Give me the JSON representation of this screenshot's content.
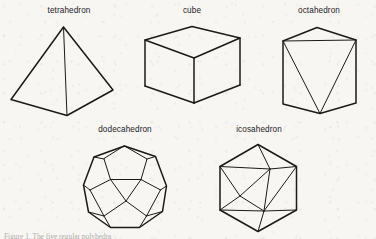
{
  "figure": {
    "background_color": "#f7f6f3",
    "ink_color": "#1c1a18",
    "kind": "line-drawing",
    "caption_partial": "Figure 1. The five regular polyhedra",
    "solids": [
      {
        "id": "tetrahedron",
        "label": "tetrahedron",
        "faces": 4,
        "label_x": 69,
        "label_y": 6
      },
      {
        "id": "cube",
        "label": "cube",
        "faces": 6,
        "label_x": 192,
        "label_y": 6
      },
      {
        "id": "octahedron",
        "label": "octahedron",
        "faces": 8,
        "label_x": 319,
        "label_y": 6
      },
      {
        "id": "dodecahedron",
        "label": "dodecahedron",
        "faces": 12,
        "label_x": 125,
        "label_y": 125
      },
      {
        "id": "icosahedron",
        "label": "icosahedron",
        "faces": 20,
        "label_x": 259,
        "label_y": 125
      }
    ]
  }
}
